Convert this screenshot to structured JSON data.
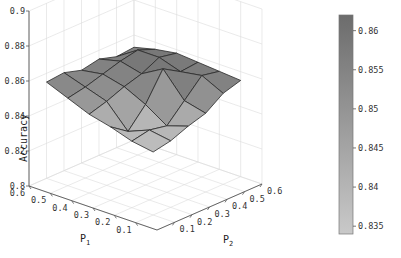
{
  "chart_data": {
    "type": "surface3d",
    "title": "",
    "xlabel": "P1",
    "ylabel": "P2",
    "zlabel": "Accuracy",
    "x_ticks": [
      0.1,
      0.2,
      0.3,
      0.4,
      0.5,
      0.6
    ],
    "y_ticks": [
      0.1,
      0.2,
      0.3,
      0.4,
      0.5,
      0.6
    ],
    "z_ticks": [
      0.8,
      0.82,
      0.84,
      0.86,
      0.88,
      0.9
    ],
    "zlim": [
      0.8,
      0.9
    ],
    "grid": true,
    "colormap": "gray",
    "colorbar": {
      "ticks": [
        0.835,
        0.84,
        0.845,
        0.85,
        0.855,
        0.86
      ],
      "range": [
        0.834,
        0.862
      ],
      "color_low": "#c9c9c9",
      "color_high": "#6c6c6c"
    },
    "p1": [
      0.1,
      0.2,
      0.3,
      0.4,
      0.5,
      0.6
    ],
    "p2": [
      0.1,
      0.2,
      0.3,
      0.4,
      0.5,
      0.6
    ],
    "accuracy": [
      [
        0.836,
        0.838,
        0.842,
        0.845,
        0.852,
        0.855
      ],
      [
        0.838,
        0.84,
        0.838,
        0.848,
        0.858,
        0.856
      ],
      [
        0.842,
        0.835,
        0.846,
        0.862,
        0.856,
        0.857
      ],
      [
        0.845,
        0.848,
        0.852,
        0.855,
        0.86,
        0.858
      ],
      [
        0.85,
        0.852,
        0.855,
        0.858,
        0.86,
        0.856
      ],
      [
        0.855,
        0.856,
        0.853,
        0.855,
        0.852,
        0.853
      ]
    ]
  },
  "labels": {
    "zlabel": "Accuracy",
    "xlabel_main": "P",
    "xlabel_sub": "1",
    "ylabel_main": "P",
    "ylabel_sub": "2"
  }
}
